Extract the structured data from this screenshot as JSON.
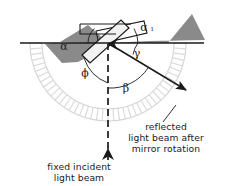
{
  "figure": {
    "background_color": "#ffffff",
    "line_color": "#1a1a1a",
    "mirror_band_color": "#8a8a8a",
    "protractor_color": "#d8d8d8",
    "mirror_face_color": "#f2f2f2"
  },
  "labels": {
    "alpha_left": "α",
    "alpha_right": "α",
    "alpha_right_sub": "ı",
    "phi": "ϕ",
    "beta": "β",
    "gamma": "γ"
  },
  "captions": {
    "incident": {
      "line1": "fixed incident",
      "line2": "light beam"
    },
    "reflected": {
      "line1": "reflected",
      "line2": "light beam after",
      "line3": "mirror rotation"
    }
  },
  "geometry": {
    "pivot_x": 108,
    "pivot_y": 43,
    "baseline_y": 43,
    "baseline_x1": 20,
    "baseline_x2": 204,
    "incident_beam_x": 108,
    "incident_beam_y_bottom": 168,
    "reflected_end_x": 190,
    "reflected_end_y": 93,
    "protractor_inner_radius": 66,
    "protractor_outer_radius": 78,
    "protractor_tick_count": 42
  }
}
